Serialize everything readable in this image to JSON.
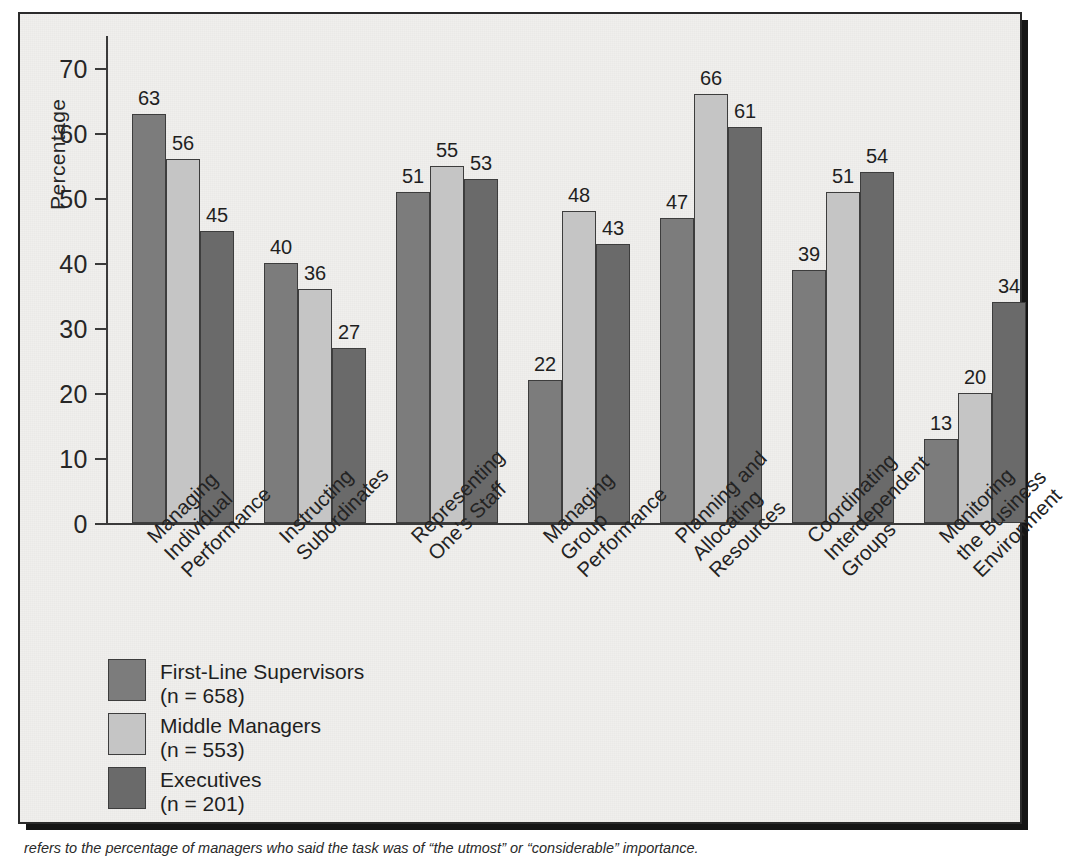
{
  "chart_data": {
    "type": "bar",
    "title": "",
    "xlabel": "",
    "ylabel": "Percentage",
    "ylim": [
      0,
      75
    ],
    "yticks": [
      0,
      10,
      20,
      30,
      40,
      50,
      60,
      70
    ],
    "grid": false,
    "legend_position": "bottom-left",
    "categories": [
      "Managing\nIndividual\nPerformance",
      "Instructing\nSubordinates",
      "Representing\nOne's Staff",
      "Managing\nGroup\nPerformance",
      "Planning and\nAllocating\nResources",
      "Coordinating\nInterdependent\nGroups",
      "Monitoring\nthe Business\nEnvironment"
    ],
    "series": [
      {
        "name": "First-Line Supervisors",
        "sub": "(n = 658)",
        "color": "#7c7c7c",
        "values": [
          63,
          40,
          51,
          22,
          47,
          39,
          13
        ]
      },
      {
        "name": "Middle Managers",
        "sub": "(n = 553)",
        "color": "#c5c5c5",
        "values": [
          56,
          36,
          55,
          48,
          66,
          51,
          20
        ]
      },
      {
        "name": "Executives",
        "sub": "(n = 201)",
        "color": "#6a6a6a",
        "values": [
          45,
          27,
          53,
          43,
          61,
          54,
          34
        ]
      }
    ]
  },
  "axis": {
    "y_title": "Percentage",
    "tick_labels": [
      "0",
      "10",
      "20",
      "30",
      "40",
      "50",
      "60",
      "70"
    ]
  },
  "categories_display": [
    [
      "Managing",
      "Individual",
      "Performance"
    ],
    [
      "Instructing",
      "Subordinates"
    ],
    [
      "Representing",
      "One's Staff"
    ],
    [
      "Managing",
      "Group",
      "Performance"
    ],
    [
      "Planning and",
      "Allocating",
      "Resources"
    ],
    [
      "Coordinating",
      "Interdependent",
      "Groups"
    ],
    [
      "Monitoring",
      "the Business",
      "Environment"
    ]
  ],
  "legend": {
    "items": [
      {
        "label": "First-Line Supervisors",
        "sub": "(n = 658)",
        "color": "#7c7c7c"
      },
      {
        "label": "Middle Managers",
        "sub": "(n = 553)",
        "color": "#c5c5c5"
      },
      {
        "label": "Executives",
        "sub": "(n = 201)",
        "color": "#6a6a6a"
      }
    ]
  },
  "caption": {
    "text": "refers to the percentage of managers who said the task was of “the utmost” or “considerable” importance."
  },
  "colors": {
    "frame_border": "#2b2b2b",
    "background": "#f0efed",
    "axis": "#3a3a3a",
    "text": "#232323"
  }
}
